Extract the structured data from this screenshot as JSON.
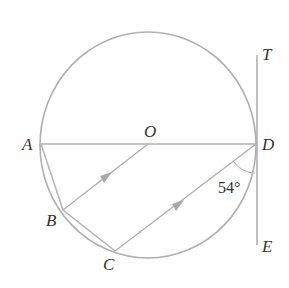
{
  "diagram": {
    "points": {
      "A": {
        "label": "A",
        "x": 41,
        "y": 144
      },
      "O": {
        "label": "O",
        "x": 148,
        "y": 144
      },
      "D": {
        "label": "D",
        "x": 256,
        "y": 144
      },
      "B": {
        "label": "B",
        "x": 63,
        "y": 210
      },
      "C": {
        "label": "C",
        "x": 115,
        "y": 251
      },
      "T": {
        "label": "T",
        "x": 257,
        "y": 55
      },
      "E": {
        "label": "E",
        "x": 257,
        "y": 245
      }
    },
    "circle": {
      "cx": 148,
      "cy": 145,
      "rx": 108,
      "ry": 113
    },
    "segments": [
      "AD",
      "AB",
      "BC",
      "OB",
      "CD",
      "TE"
    ],
    "parallel_marks": [
      "OB",
      "CD"
    ],
    "angle": {
      "vertex": "D",
      "between": [
        "CD",
        "DE"
      ],
      "value": "54°"
    },
    "colors": {
      "stroke": "#b0b0b0",
      "text": "#333333"
    }
  }
}
